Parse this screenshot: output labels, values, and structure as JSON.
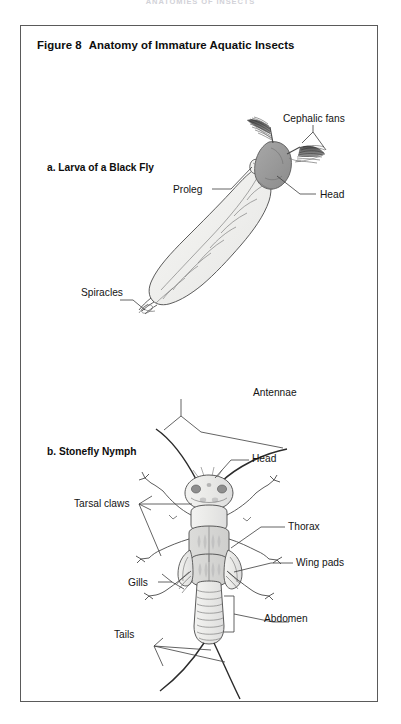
{
  "page": {
    "running_header": "ANATOMIES OF INSECTS",
    "background_color": "#ffffff",
    "frame_color": "#5a5a5a"
  },
  "figure": {
    "number": "Figure 8",
    "title": "Anatomy of Immature Aquatic Insects"
  },
  "panels": [
    {
      "id": "a",
      "label": "a. Larva of a Black Fly",
      "callouts": [
        {
          "name": "cephalic-fans",
          "text": "Cephalic fans"
        },
        {
          "name": "head",
          "text": "Head"
        },
        {
          "name": "proleg",
          "text": "Proleg"
        },
        {
          "name": "spiracles",
          "text": "Spiracles"
        }
      ]
    },
    {
      "id": "b",
      "label": "b. Stonefly Nymph",
      "callouts": [
        {
          "name": "antennae",
          "text": "Antennae"
        },
        {
          "name": "head",
          "text": "Head"
        },
        {
          "name": "tarsal-claws",
          "text": "Tarsal claws"
        },
        {
          "name": "thorax",
          "text": "Thorax"
        },
        {
          "name": "wing-pads",
          "text": "Wing pads"
        },
        {
          "name": "gills",
          "text": "Gills"
        },
        {
          "name": "abdomen",
          "text": "Abdomen"
        },
        {
          "name": "tails",
          "text": "Tails"
        }
      ]
    }
  ],
  "colors": {
    "ink": "#141414",
    "outline": "#4a4a4a",
    "body_fill": "#f0f0ee",
    "head_fill": "#9a9a9a",
    "mottle_fill": "#c8c8c8",
    "leader_line": "#3c3c3c"
  }
}
